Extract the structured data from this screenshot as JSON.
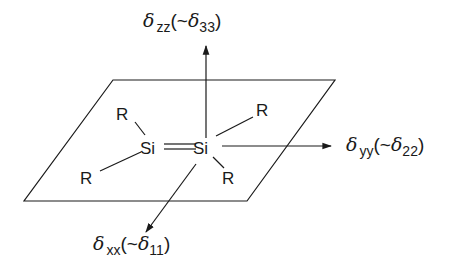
{
  "diagram": {
    "plane": {
      "points": [
        [
          113,
          80
        ],
        [
          335,
          80
        ],
        [
          247,
          201
        ],
        [
          24,
          201
        ]
      ]
    },
    "molecule": {
      "si_left": "Si",
      "si_right": "Si",
      "double_bond": "=",
      "substituents": [
        "R",
        "R",
        "R",
        "R"
      ]
    },
    "axes": {
      "zz": {
        "symbol": "δ",
        "subscript": "zz",
        "approx_prefix": "(~",
        "approx_symbol": "δ",
        "approx_subscript": "33",
        "suffix": ")"
      },
      "yy": {
        "symbol": "δ",
        "subscript": "yy",
        "approx_prefix": "(~",
        "approx_symbol": "δ",
        "approx_subscript": "22",
        "suffix": ")"
      },
      "xx": {
        "symbol": "δ",
        "subscript": "xx",
        "approx_prefix": "(~",
        "approx_symbol": "δ",
        "approx_subscript": "11",
        "suffix": ")"
      }
    },
    "colors": {
      "stroke": "#1a1a1a",
      "background": "#ffffff"
    }
  }
}
